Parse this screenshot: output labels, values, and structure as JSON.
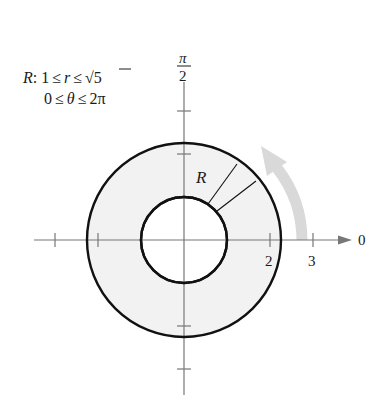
{
  "region": {
    "name": "R",
    "line1": "R: 1 ≤ r ≤ √5",
    "line1_parts": {
      "name": "R",
      "colon": ":",
      "lower": "1",
      "leq": "≤",
      "var": "r",
      "upper_radical": "√",
      "upper_value": "5"
    },
    "line2": "0 ≤ θ ≤ 2π",
    "line2_parts": {
      "lower": "0",
      "var": "θ",
      "upper": "2π"
    }
  },
  "axes": {
    "polar_axis_label": "0",
    "vertical_label_numerator": "π",
    "vertical_label_denominator": "2",
    "tick_labels": [
      "2",
      "3"
    ]
  },
  "shape": {
    "inner_radius": 1,
    "outer_radius": "√5",
    "region_label": "R",
    "fill_color": "#f2f2f2",
    "stroke_color": "#111111",
    "arrow_color": "#d9d9d9"
  }
}
